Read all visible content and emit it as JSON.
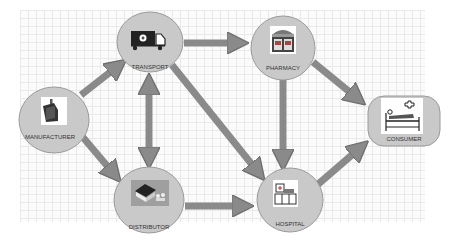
{
  "diagram": {
    "type": "supply-chain-flow",
    "colors": {
      "node_fill": "#c9c9c9",
      "node_stroke": "#9a9a9a",
      "arrow_fill": "#8a8a8a",
      "arrow_stroke": "#6e6e6e",
      "grid_line": "#e9e9e9",
      "label_text": "#333333"
    },
    "nodes": [
      {
        "id": "manufacturer",
        "label": "MANUFACTURER",
        "shape": "ellipse",
        "icon": "factory-icon"
      },
      {
        "id": "transport",
        "label": "TRANSPORT",
        "shape": "ellipse",
        "icon": "delivery-truck-icon"
      },
      {
        "id": "pharmacy",
        "label": "PHARMACY",
        "shape": "ellipse",
        "icon": "pharmacy-storefront-icon"
      },
      {
        "id": "consumer",
        "label": "CONSUMER",
        "shape": "rounded-rectangle",
        "icon": "patient-bed-icon"
      },
      {
        "id": "distributor",
        "label": "DISTRIBUTOR",
        "shape": "ellipse",
        "icon": "warehouse-icon"
      },
      {
        "id": "hospital",
        "label": "HOSPITAL",
        "shape": "ellipse",
        "icon": "hospital-building-icon"
      }
    ],
    "edges": [
      {
        "from": "manufacturer",
        "to": "transport",
        "direction": "one-way"
      },
      {
        "from": "manufacturer",
        "to": "distributor",
        "direction": "one-way"
      },
      {
        "from": "transport",
        "to": "pharmacy",
        "direction": "one-way"
      },
      {
        "from": "transport",
        "to": "distributor",
        "direction": "two-way"
      },
      {
        "from": "transport",
        "to": "hospital",
        "direction": "one-way"
      },
      {
        "from": "pharmacy",
        "to": "consumer",
        "direction": "one-way"
      },
      {
        "from": "pharmacy",
        "to": "hospital",
        "direction": "one-way"
      },
      {
        "from": "distributor",
        "to": "hospital",
        "direction": "one-way"
      },
      {
        "from": "hospital",
        "to": "consumer",
        "direction": "one-way"
      }
    ]
  }
}
